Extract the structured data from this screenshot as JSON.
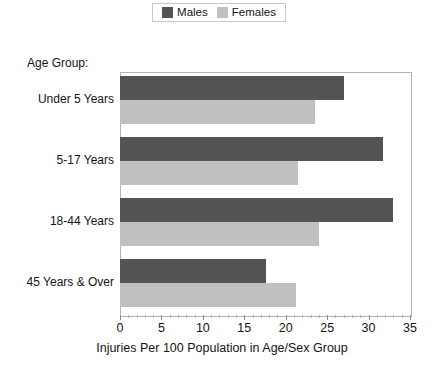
{
  "legend": {
    "position": "top-center",
    "entries": [
      {
        "label": "Males",
        "color": "#545454",
        "icon": "square-swatch-icon"
      },
      {
        "label": "Females",
        "color": "#c0c0c0",
        "icon": "square-swatch-icon"
      }
    ]
  },
  "axes": {
    "group_title": "Age Group:",
    "x_title": "Injuries Per 100 Population in Age/Sex Group",
    "x_ticks": [
      "0",
      "5",
      "10",
      "15",
      "20",
      "25",
      "30",
      "35"
    ]
  },
  "chart_data": {
    "type": "bar",
    "orientation": "horizontal",
    "title": "",
    "subtitle": "",
    "xlabel": "Injuries Per 100 Population in Age/Sex Group",
    "ylabel": "Age Group:",
    "xlim": [
      0,
      35
    ],
    "xticks": [
      0,
      5,
      10,
      15,
      20,
      25,
      30,
      35
    ],
    "grid": false,
    "legend_position": "top-center",
    "categories": [
      "Under 5 Years",
      "5-17 Years",
      "18-44 Years",
      "45 Years & Over"
    ],
    "series": [
      {
        "name": "Males",
        "color": "#545454",
        "values": [
          27.0,
          31.8,
          32.9,
          17.6
        ]
      },
      {
        "name": "Females",
        "color": "#c0c0c0",
        "values": [
          23.5,
          21.5,
          24.0,
          21.2
        ]
      }
    ]
  }
}
